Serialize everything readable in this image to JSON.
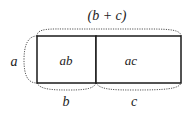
{
  "diagram": {
    "title_label": "(b + c)",
    "side_label": "a",
    "regions": [
      {
        "label": "ab"
      },
      {
        "label": "ac"
      }
    ],
    "bottom_labels": [
      "b",
      "c"
    ],
    "colors": {
      "stroke": "#1a1a1a",
      "dotted": "#555555",
      "text": "#222222"
    }
  }
}
